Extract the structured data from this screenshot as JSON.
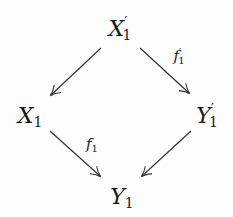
{
  "diagram": {
    "type": "commutative-square",
    "nodes": [
      {
        "id": "Xp",
        "base": "X",
        "sub": "1",
        "prime": "′",
        "x": 120,
        "y": 30
      },
      {
        "id": "X",
        "base": "X",
        "sub": "1",
        "prime": "",
        "x": 30,
        "y": 117
      },
      {
        "id": "Yp",
        "base": "Y",
        "sub": "1",
        "prime": "′",
        "x": 207,
        "y": 117
      },
      {
        "id": "Y",
        "base": "Y",
        "sub": "1",
        "prime": "",
        "x": 122,
        "y": 198
      }
    ],
    "edges": [
      {
        "from": "Xp",
        "to": "X",
        "label": ""
      },
      {
        "from": "Xp",
        "to": "Yp",
        "label": "f1'"
      },
      {
        "from": "X",
        "to": "Y",
        "label": "f1"
      },
      {
        "from": "Yp",
        "to": "Y",
        "label": ""
      }
    ],
    "labels": {
      "f1p": {
        "base": "f",
        "sub": "1",
        "prime": "′"
      },
      "f1": {
        "base": "f",
        "sub": "1"
      }
    }
  }
}
